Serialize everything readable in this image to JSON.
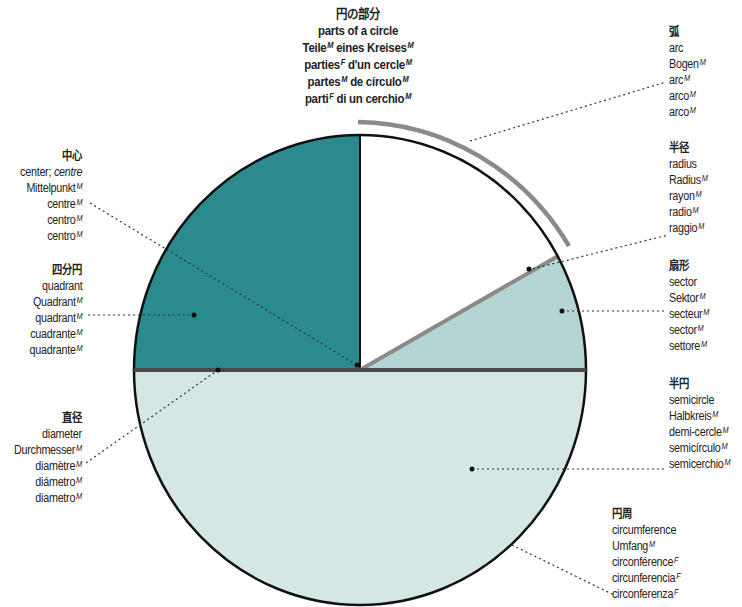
{
  "title": {
    "lines": [
      {
        "text": "円の部分",
        "g": ""
      },
      {
        "text": "parts of a circle",
        "g": ""
      },
      {
        "text": "Teile",
        "g": "M",
        "rest": " eines Kreises",
        "g2": "M"
      },
      {
        "text": "parties",
        "g": "F",
        "rest": " d'un cercle",
        "g2": "M"
      },
      {
        "text": "partes",
        "g": "M",
        "rest": " de círculo",
        "g2": "M"
      },
      {
        "text": "parti",
        "g": "F",
        "rest": " di un cerchio",
        "g2": "M"
      }
    ]
  },
  "labels": {
    "arc": {
      "heading": "弧",
      "terms": [
        {
          "text": "arc",
          "g": ""
        },
        {
          "text": "Bogen",
          "g": "M"
        },
        {
          "text": "arc",
          "g": "M"
        },
        {
          "text": "arco",
          "g": "M"
        },
        {
          "text": "arco",
          "g": "M"
        }
      ]
    },
    "radius": {
      "heading": "半径",
      "terms": [
        {
          "text": "radius",
          "g": ""
        },
        {
          "text": "Radius",
          "g": "M"
        },
        {
          "text": "rayon",
          "g": "M"
        },
        {
          "text": "radio",
          "g": "M"
        },
        {
          "text": "raggio",
          "g": "M"
        }
      ]
    },
    "sector": {
      "heading": "扇形",
      "terms": [
        {
          "text": "sector",
          "g": ""
        },
        {
          "text": "Sektor",
          "g": "M"
        },
        {
          "text": "secteur",
          "g": "M"
        },
        {
          "text": "sector",
          "g": "M"
        },
        {
          "text": "settore",
          "g": "M"
        }
      ]
    },
    "semicircle": {
      "heading": "半円",
      "terms": [
        {
          "text": "semicircle",
          "g": ""
        },
        {
          "text": "Halbkreis",
          "g": "M"
        },
        {
          "text": "demi-cercle",
          "g": "M"
        },
        {
          "text": "semicírculo",
          "g": "M"
        },
        {
          "text": "semicerchio",
          "g": "M"
        }
      ]
    },
    "circumference": {
      "heading": "円周",
      "terms": [
        {
          "text": "circumference",
          "g": ""
        },
        {
          "text": "Umfang",
          "g": "M"
        },
        {
          "text": "circonférence",
          "g": "F"
        },
        {
          "text": "circunferencia",
          "g": "F"
        },
        {
          "text": "circonferenza",
          "g": "F"
        }
      ]
    },
    "center": {
      "heading": "中心",
      "terms": [
        {
          "text": "center; ",
          "g": "",
          "alt": "centre"
        },
        {
          "text": "Mittelpunkt",
          "g": "M"
        },
        {
          "text": "centre",
          "g": "M"
        },
        {
          "text": "centro",
          "g": "M"
        },
        {
          "text": "centro",
          "g": "M"
        }
      ]
    },
    "quadrant": {
      "heading": "四分円",
      "terms": [
        {
          "text": "quadrant",
          "g": ""
        },
        {
          "text": "Quadrant",
          "g": "M"
        },
        {
          "text": "quadrant",
          "g": "M"
        },
        {
          "text": "cuadrante",
          "g": "M"
        },
        {
          "text": "quadrante",
          "g": "M"
        }
      ]
    },
    "diameter": {
      "heading": "直径",
      "terms": [
        {
          "text": "diameter",
          "g": ""
        },
        {
          "text": "Durchmesser",
          "g": "M"
        },
        {
          "text": "diamètre",
          "g": "M"
        },
        {
          "text": "diámetro",
          "g": "M"
        },
        {
          "text": "diametro",
          "g": "M"
        }
      ]
    }
  },
  "colors": {
    "quadrant": "#2a8a8e",
    "sector": "#b5d5d3",
    "semicircle": "#d4e7e4",
    "white_region": "#ffffff",
    "outline": "#111111",
    "diameter_line": "#4a4a4a",
    "arc_and_radius": "#8a8a8a"
  }
}
